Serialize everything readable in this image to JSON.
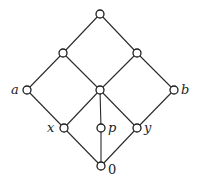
{
  "diagram": {
    "type": "hasse-diagram",
    "node_color": "#ffffff",
    "stroke_color": "#1e1e1e",
    "nodes": [
      {
        "id": "top",
        "label": "",
        "x": 100,
        "y": 14
      },
      {
        "id": "l2",
        "label": "",
        "x": 63,
        "y": 53
      },
      {
        "id": "r2",
        "label": "",
        "x": 137,
        "y": 53
      },
      {
        "id": "a",
        "label": "a",
        "x": 27,
        "y": 90
      },
      {
        "id": "c",
        "label": "",
        "x": 100,
        "y": 90
      },
      {
        "id": "b",
        "label": "b",
        "x": 174,
        "y": 90
      },
      {
        "id": "x",
        "label": "x",
        "x": 64,
        "y": 128
      },
      {
        "id": "p",
        "label": "p",
        "x": 101,
        "y": 128
      },
      {
        "id": "y",
        "label": "y",
        "x": 137,
        "y": 128
      },
      {
        "id": "zero",
        "label": "0",
        "x": 101,
        "y": 166
      }
    ],
    "edges": [
      [
        "top",
        "l2"
      ],
      [
        "top",
        "r2"
      ],
      [
        "l2",
        "a"
      ],
      [
        "l2",
        "c"
      ],
      [
        "r2",
        "c"
      ],
      [
        "r2",
        "b"
      ],
      [
        "a",
        "x"
      ],
      [
        "c",
        "x"
      ],
      [
        "c",
        "p"
      ],
      [
        "c",
        "y"
      ],
      [
        "b",
        "y"
      ],
      [
        "x",
        "zero"
      ],
      [
        "p",
        "zero"
      ],
      [
        "y",
        "zero"
      ]
    ],
    "labels": {
      "a": "a",
      "b": "b",
      "x": "x",
      "p": "p",
      "y": "y",
      "zero": "0"
    }
  }
}
